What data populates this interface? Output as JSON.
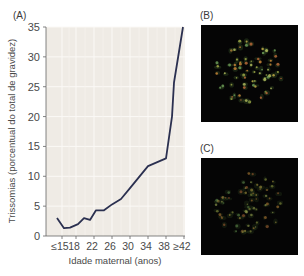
{
  "panels": {
    "a_label": "(A)",
    "b_label": "(B)",
    "c_label": "(C)"
  },
  "chart_data": {
    "type": "line",
    "title": "",
    "xlabel": "Idade maternal (anos)",
    "ylabel": "Trissomias (porcentual do total de gravidez)",
    "ylim": [
      0,
      35
    ],
    "yticks": [
      0,
      5,
      10,
      15,
      20,
      25,
      30,
      35
    ],
    "ytick_labels": [
      "0",
      "5",
      "10",
      "15",
      "20",
      "25",
      "30",
      "35"
    ],
    "xtick_labels": [
      "≤15",
      "18",
      "22",
      "26",
      "30",
      "34",
      "38",
      "≥42"
    ],
    "grid": true,
    "legend": null,
    "x": [
      15,
      16,
      18,
      20,
      22,
      24,
      26,
      28,
      30,
      32,
      34,
      36,
      38,
      39,
      40,
      41
    ],
    "series": [
      {
        "name": "Trissomias",
        "color": "#2b3050",
        "values": [
          3.0,
          1.3,
          1.4,
          2.0,
          3.0,
          2.7,
          4.3,
          4.3,
          5.3,
          6.2,
          8.0,
          11.7,
          13.0,
          20.0,
          25.7,
          35.0
        ]
      }
    ]
  },
  "images": {
    "b_alt": "Cariótipo fluorescente (B)",
    "c_alt": "Cariótipo fluorescente (C)"
  }
}
